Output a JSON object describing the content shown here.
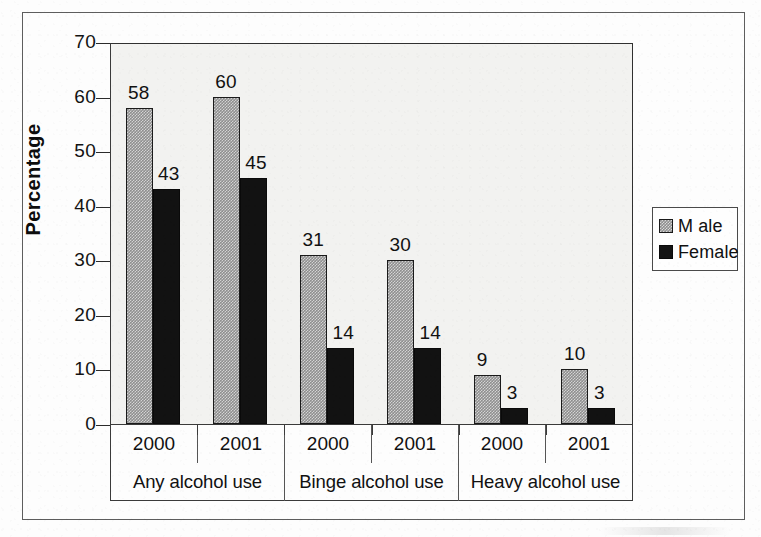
{
  "chart_data": {
    "type": "bar",
    "title": "",
    "xlabel": "",
    "ylabel": "Percentage",
    "ylim": [
      0,
      70
    ],
    "ytick_values": [
      70,
      60,
      50,
      40,
      30,
      20,
      10,
      0
    ],
    "ytick_labels": [
      "70",
      "60",
      "50",
      "40",
      "30",
      "20",
      "10",
      "0"
    ],
    "ytick_step": 10,
    "grid": false,
    "legend_position": "right",
    "categories": [
      "2000",
      "2001",
      "2000",
      "2001",
      "2000",
      "2001"
    ],
    "group_labels": [
      "Any alcohol use",
      "Binge alcohol use",
      "Heavy alcohol use"
    ],
    "series": [
      {
        "name": "M ale",
        "values": [
          58,
          60,
          31,
          30,
          9,
          10
        ],
        "fill": "dithered-gray",
        "color": "#8f8f8f"
      },
      {
        "name": "Female",
        "values": [
          43,
          45,
          14,
          14,
          3,
          3
        ],
        "fill": "solid-black",
        "color": "#121212"
      }
    ],
    "data_labels": [
      {
        "group": "Any alcohol use",
        "year": "2000",
        "male": "58",
        "female": "43"
      },
      {
        "group": "Any alcohol use",
        "year": "2001",
        "male": "60",
        "female": "45"
      },
      {
        "group": "Binge alcohol use",
        "year": "2000",
        "male": "31",
        "female": "14"
      },
      {
        "group": "Binge alcohol use",
        "year": "2001",
        "male": "30",
        "female": "14"
      },
      {
        "group": "Heavy alcohol use",
        "year": "2000",
        "male": "9",
        "female": "3"
      },
      {
        "group": "Heavy alcohol use",
        "year": "2001",
        "male": "10",
        "female": "3"
      }
    ]
  },
  "axis": {
    "y_title": "Percentage",
    "y_labels": [
      "70",
      "60",
      "50",
      "40",
      "30",
      "20",
      "10",
      "0"
    ]
  },
  "x_axis": {
    "years": [
      "2000",
      "2001",
      "2000",
      "2001",
      "2000",
      "2001"
    ],
    "groups": [
      "Any alcohol use",
      "Binge alcohol use",
      "Heavy alcohol use"
    ]
  },
  "legend": {
    "items": [
      {
        "label": "M ale",
        "swatch": "male-dithered-swatch"
      },
      {
        "label": "Female",
        "swatch": "female-solid-swatch"
      }
    ]
  },
  "bar_labels": {
    "male": [
      "58",
      "60",
      "31",
      "30",
      "9",
      "10"
    ],
    "female": [
      "43",
      "45",
      "14",
      "14",
      "3",
      "3"
    ]
  },
  "colors": {
    "male_fill": "#8f8f8f",
    "female_fill": "#121212",
    "plot_background": "#f2f2f0",
    "frame": "#5d5d5d",
    "text": "#111111"
  }
}
